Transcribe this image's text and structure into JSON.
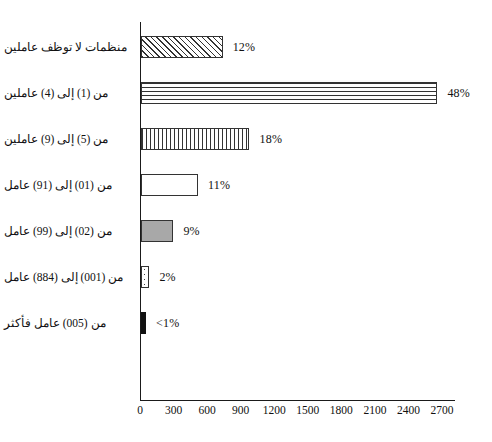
{
  "chart_data": {
    "type": "bar",
    "orientation": "horizontal",
    "title": "",
    "subtitle": "",
    "xlabel": "",
    "ylabel": "",
    "grid": false,
    "legend": false,
    "xlim": [
      0,
      2800
    ],
    "xticks": [
      0,
      300,
      600,
      900,
      1200,
      1500,
      1800,
      2100,
      2400,
      2700
    ],
    "categories": [
      "منظمات لا توظف عاملين",
      "من (1) إلى (4) عاملين",
      "من (5) إلى (9) عاملين",
      "من (10) إلى (19) عامل",
      "من (20) إلى (99) عامل",
      "من (100) إلى (488) عامل",
      "من (500) عامل فأكثر"
    ],
    "values": [
      730,
      2650,
      970,
      510,
      290,
      75,
      45
    ],
    "data_labels": [
      "12%",
      "48%",
      "18%",
      "11%",
      "9%",
      "2%",
      "<1%"
    ],
    "fills": [
      "diagonal-hatch",
      "horizontal-stripes",
      "vertical-stripes",
      "white",
      "gray",
      "dotted",
      "black"
    ]
  },
  "rows": [
    {
      "label": "منظمات لا توظف عاملين",
      "value": 730,
      "data_label": "12%",
      "fill": "fill-diagonal"
    },
    {
      "label": "من (1) إلى (4) عاملين",
      "value": 2650,
      "data_label": "48%",
      "fill": "fill-horizontal"
    },
    {
      "label": "من (5) إلى (9) عاملين",
      "value": 970,
      "data_label": "18%",
      "fill": "fill-vertical"
    },
    {
      "label": "من (10) إلى (19) عامل",
      "value": 510,
      "data_label": "11%",
      "fill": "fill-white"
    },
    {
      "label": "من (20) إلى (99) عامل",
      "value": 290,
      "data_label": "9%",
      "fill": "fill-gray"
    },
    {
      "label": "من (100) إلى (488) عامل",
      "value": 75,
      "data_label": "2%",
      "fill": "fill-dotted"
    },
    {
      "label": "من (500) عامل فأكثر",
      "value": 45,
      "data_label": "<1%",
      "fill": "fill-black"
    }
  ],
  "axis": {
    "ticks": [
      "0",
      "300",
      "600",
      "900",
      "1200",
      "1500",
      "1800",
      "2100",
      "2400",
      "2700"
    ],
    "tick_values": [
      0,
      300,
      600,
      900,
      1200,
      1500,
      1800,
      2100,
      2400,
      2700
    ],
    "max": 2800
  },
  "colors": {
    "axis": "#1a1a1a",
    "bar_outline": "#333333",
    "gray_fill": "#a8a8a8",
    "black_fill": "#111111",
    "text": "#111111",
    "background": "#ffffff"
  }
}
